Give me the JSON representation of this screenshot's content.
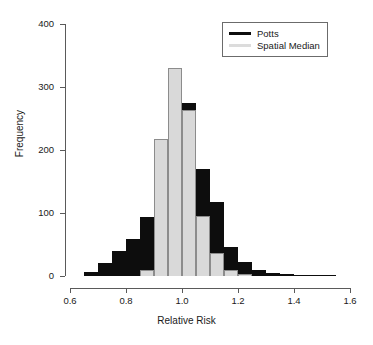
{
  "chart_data": {
    "type": "bar",
    "title": "",
    "xlabel": "Relative Risk",
    "ylabel": "Frequency",
    "xlim": [
      0.6,
      1.6
    ],
    "ylim": [
      0,
      400
    ],
    "xticks": [
      "0.6",
      "0.8",
      "1.0",
      "1.2",
      "1.4",
      "1.6"
    ],
    "yticks": [
      "0",
      "100",
      "200",
      "300",
      "400"
    ],
    "grid": false,
    "legend_position": "top-right",
    "bin_width": 0.05,
    "colors": {
      "potts": "#0d0d0d",
      "spatial_median": "#d9d9d9"
    },
    "series": [
      {
        "name": "Potts",
        "bin_starts": [
          0.65,
          0.7,
          0.75,
          0.8,
          0.85,
          0.9,
          0.95,
          1.0,
          1.05,
          1.1,
          1.15,
          1.2,
          1.25,
          1.3,
          1.35,
          1.4,
          1.45,
          1.5
        ],
        "values": [
          6,
          20,
          40,
          58,
          93,
          148,
          210,
          275,
          170,
          118,
          46,
          22,
          9,
          5,
          3,
          2,
          2,
          2
        ]
      },
      {
        "name": "Spatial Median",
        "bin_starts": [
          0.85,
          0.9,
          0.95,
          1.0,
          1.05,
          1.1,
          1.15,
          1.2
        ],
        "values": [
          9,
          218,
          330,
          264,
          96,
          36,
          9,
          3
        ]
      }
    ]
  },
  "legend": {
    "entries": [
      {
        "label": "Potts",
        "swatch": "potts"
      },
      {
        "label": "Spatial Median",
        "swatch": "spatial"
      }
    ]
  },
  "axes": {
    "x_title": "Relative Risk",
    "y_title": "Frequency"
  }
}
